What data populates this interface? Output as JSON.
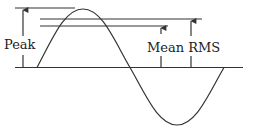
{
  "diagram": {
    "labels": {
      "peak": "Peak",
      "mean_rms": "Mean RMS"
    },
    "colors": {
      "stroke": "#333333",
      "text": "#222222",
      "background": "#ffffff"
    },
    "elements": [
      {
        "name": "baseline",
        "type": "line"
      },
      {
        "name": "sine-wave",
        "type": "curve"
      },
      {
        "name": "peak-level-line",
        "type": "line"
      },
      {
        "name": "rms-level-line",
        "type": "line"
      },
      {
        "name": "mean-level-line",
        "type": "line"
      },
      {
        "name": "peak-arrow",
        "type": "arrow"
      },
      {
        "name": "mean-arrow",
        "type": "arrow"
      },
      {
        "name": "rms-arrow",
        "type": "arrow"
      }
    ]
  }
}
